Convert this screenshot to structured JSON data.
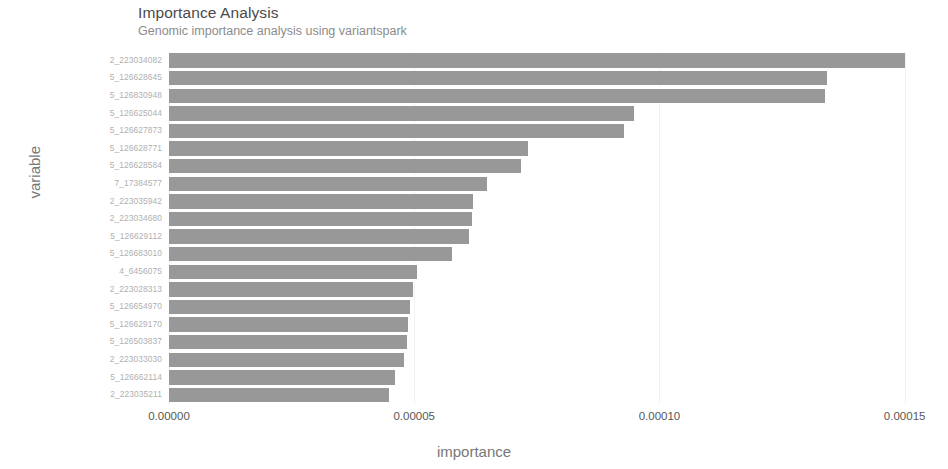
{
  "header": {
    "title": "Importance Analysis",
    "subtitle": "Genomic importance analysis using variantspark"
  },
  "axes": {
    "x_title": "importance",
    "y_title": "variable"
  },
  "colors": {
    "bar": "#989898",
    "grid": "#f2f2f2",
    "title_text": "#4a4a4a",
    "subtitle_text": "#8c8c8c",
    "axis_title_text": "#777777",
    "y_tick_text": "#b0b0b0",
    "x_tick_text": "#575757",
    "background": "#ffffff"
  },
  "chart_data": {
    "type": "bar",
    "orientation": "horizontal",
    "title": "Importance Analysis",
    "subtitle": "Genomic importance analysis using variantspark",
    "xlabel": "importance",
    "ylabel": "variable",
    "xlim": [
      0,
      0.000157
    ],
    "xticks": [
      "0.00000",
      "0.00005",
      "0.00010",
      "0.00015"
    ],
    "xtick_values": [
      0.0,
      5e-05,
      0.0001,
      0.00015
    ],
    "grid": true,
    "legend": "none",
    "categories": [
      "2_223034082",
      "5_126628645",
      "5_126830948",
      "5_126625044",
      "5_126627873",
      "5_126628771",
      "5_126628584",
      "7_17384577",
      "2_223035942",
      "2_223034680",
      "5_126629112",
      "5_126683010",
      "4_6456075",
      "2_223028313",
      "5_126654970",
      "5_126629170",
      "5_126503837",
      "2_223033030",
      "5_126662114",
      "2_223035211"
    ],
    "values": [
      0.00015,
      0.0001341,
      0.0001337,
      9.49e-05,
      9.28e-05,
      7.33e-05,
      7.18e-05,
      6.49e-05,
      6.2e-05,
      6.18e-05,
      6.12e-05,
      5.77e-05,
      5.05e-05,
      4.97e-05,
      4.92e-05,
      4.88e-05,
      4.85e-05,
      4.8e-05,
      4.6e-05,
      4.49e-05
    ]
  }
}
